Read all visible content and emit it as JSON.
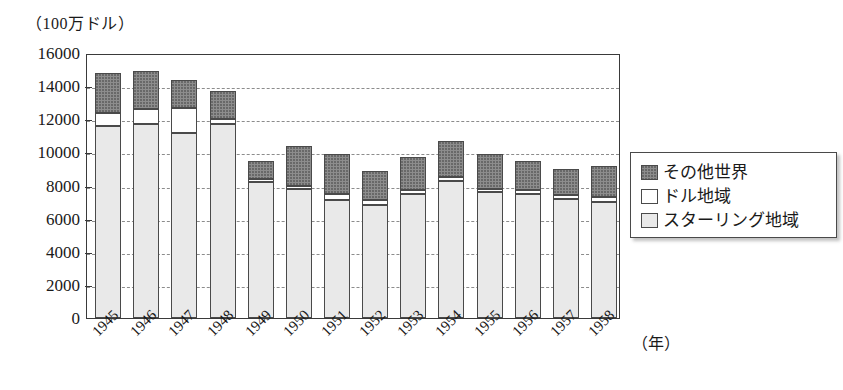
{
  "unit_caption": "（100万ドル）",
  "x_axis_unit": "（年）",
  "colors": {
    "other_world": "#8d8d8d",
    "dollar_area": "#ffffff",
    "sterling_area": "#e9e9e9",
    "axis": "#3a3a3a",
    "grid": "#8c8c8c"
  },
  "legend": {
    "items": [
      {
        "label": "その他世界",
        "key": "other_world",
        "swatch": "#8d8d8d"
      },
      {
        "label": "ドル地域",
        "key": "dollar_area",
        "swatch": "#ffffff"
      },
      {
        "label": "スターリング地域",
        "key": "sterling_area",
        "swatch": "#e9e9e9"
      }
    ]
  },
  "chart_data": {
    "type": "bar",
    "stacked": true,
    "title": "",
    "xlabel": "（年）",
    "ylabel": "（100万ドル）",
    "ylim": [
      0,
      16000
    ],
    "ytick_step": 2000,
    "yticks": [
      0,
      2000,
      4000,
      6000,
      8000,
      10000,
      12000,
      14000,
      16000
    ],
    "ytick_labels": [
      "0",
      "2000",
      "4000",
      "6000",
      "8000",
      "10000",
      "12000",
      "14000",
      "16000"
    ],
    "grid": true,
    "grid_axis": "y",
    "legend_position": "right",
    "categories": [
      "1945",
      "1946",
      "1947",
      "1948",
      "1949",
      "1950",
      "1951",
      "1952",
      "1953",
      "1954",
      "1955",
      "1956",
      "1957",
      "1958"
    ],
    "series": [
      {
        "name": "スターリング地域",
        "color": "#e9e9e9",
        "values": [
          11600,
          11700,
          11200,
          11700,
          8200,
          7800,
          7100,
          6800,
          7500,
          8300,
          7600,
          7500,
          7200,
          7000
        ]
      },
      {
        "name": "ドル地域",
        "color": "#ffffff",
        "values": [
          800,
          900,
          1500,
          300,
          200,
          200,
          400,
          300,
          200,
          200,
          200,
          200,
          200,
          300
        ]
      },
      {
        "name": "その他世界",
        "color": "#8d8d8d",
        "values": [
          2400,
          2300,
          1700,
          1700,
          1100,
          2400,
          2400,
          1800,
          2000,
          2200,
          2100,
          1800,
          1600,
          1900
        ]
      }
    ],
    "totals": [
      14800,
      14900,
      14400,
      13700,
      9500,
      10400,
      9900,
      8900,
      9700,
      10700,
      9900,
      9500,
      9000,
      9200
    ]
  }
}
